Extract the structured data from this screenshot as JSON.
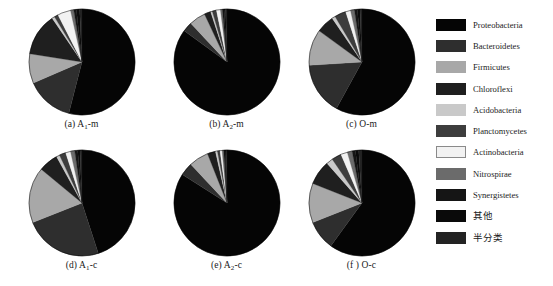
{
  "figure": {
    "background": "#ffffff"
  },
  "legend": {
    "position": "right",
    "items": [
      {
        "label": "Proteobacteria",
        "color": "#050505",
        "script": "latin"
      },
      {
        "label": "Bacteroidetes",
        "color": "#2e2e2e",
        "script": "latin"
      },
      {
        "label": "Firmicutes",
        "color": "#a8a8a8",
        "script": "latin"
      },
      {
        "label": "Chloroflexi",
        "color": "#1f1f1f",
        "script": "latin"
      },
      {
        "label": "Acidobacteria",
        "color": "#c9c9c9",
        "script": "latin"
      },
      {
        "label": "Planctomycetes",
        "color": "#3d3d3d",
        "script": "latin"
      },
      {
        "label": "Actinobacteria",
        "color": "#f2f2f2",
        "script": "latin"
      },
      {
        "label": "Nitrospirae",
        "color": "#6b6b6b",
        "script": "latin"
      },
      {
        "label": "Synergistetes",
        "color": "#151515",
        "script": "latin"
      },
      {
        "label": "其他",
        "color": "#0a0a0a",
        "script": "cjk"
      },
      {
        "label": "半分类",
        "color": "#232323",
        "script": "cjk"
      }
    ]
  },
  "chart_data": [
    {
      "type": "pie",
      "id": "a",
      "caption_prefix": "(a)",
      "caption_base": "A",
      "caption_sub": "1",
      "caption_suffix": "-m",
      "caption_text": "(a) A1-m",
      "start_angle": 0,
      "direction": "clockwise",
      "categories": [
        "Proteobacteria",
        "Bacteroidetes",
        "Firmicutes",
        "Chloroflexi",
        "Acidobacteria",
        "Planctomycetes",
        "Actinobacteria",
        "Nitrospirae",
        "Synergistetes",
        "其他",
        "半分类"
      ],
      "values": [
        54.0,
        14.5,
        9.0,
        13.0,
        0.8,
        1.2,
        4.0,
        1.0,
        0.8,
        1.0,
        0.7
      ],
      "title": "(a) A1-m"
    },
    {
      "type": "pie",
      "id": "b",
      "caption_prefix": "(b)",
      "caption_base": "A",
      "caption_sub": "2",
      "caption_suffix": "-m",
      "caption_text": "(b) A2-m",
      "start_angle": 0,
      "direction": "clockwise",
      "categories": [
        "Proteobacteria",
        "Bacteroidetes",
        "Firmicutes",
        "Chloroflexi",
        "Acidobacteria",
        "Planctomycetes",
        "Actinobacteria",
        "Nitrospirae",
        "Synergistetes",
        "其他",
        "半分类"
      ],
      "values": [
        85.0,
        3.0,
        5.0,
        2.0,
        0.5,
        1.3,
        1.2,
        0.6,
        0.5,
        0.5,
        0.4
      ],
      "title": "(b) A2-m"
    },
    {
      "type": "pie",
      "id": "c",
      "caption_prefix": "(c)",
      "caption_base": "O",
      "caption_sub": "",
      "caption_suffix": "-m",
      "caption_text": "(c) O-m",
      "start_angle": 0,
      "direction": "clockwise",
      "categories": [
        "Proteobacteria",
        "Bacteroidetes",
        "Firmicutes",
        "Chloroflexi",
        "Acidobacteria",
        "Planctomycetes",
        "Actinobacteria",
        "Nitrospirae",
        "Synergistetes",
        "其他",
        "半分类"
      ],
      "values": [
        58.0,
        16.0,
        11.0,
        5.5,
        1.0,
        3.5,
        1.5,
        1.2,
        0.9,
        0.8,
        0.6
      ],
      "title": "(c) O-m"
    },
    {
      "type": "pie",
      "id": "d",
      "caption_prefix": "(d)",
      "caption_base": "A",
      "caption_sub": "1",
      "caption_suffix": "-c",
      "caption_text": "(d) A1-c",
      "start_angle": 0,
      "direction": "clockwise",
      "categories": [
        "Proteobacteria",
        "Bacteroidetes",
        "Firmicutes",
        "Chloroflexi",
        "Acidobacteria",
        "Planctomycetes",
        "Actinobacteria",
        "Nitrospirae",
        "Synergistetes",
        "其他",
        "半分类"
      ],
      "values": [
        45.0,
        24.0,
        17.0,
        6.0,
        1.0,
        2.0,
        1.5,
        1.3,
        0.9,
        0.7,
        0.6
      ],
      "title": "(d) A1-c"
    },
    {
      "type": "pie",
      "id": "e",
      "caption_prefix": "(e)",
      "caption_base": "A",
      "caption_sub": "2",
      "caption_suffix": "-c",
      "caption_text": "(e) A2-c",
      "start_angle": 0,
      "direction": "clockwise",
      "categories": [
        "Proteobacteria",
        "Bacteroidetes",
        "Firmicutes",
        "Chloroflexi",
        "Acidobacteria",
        "Planctomycetes",
        "Actinobacteria",
        "Nitrospirae",
        "Synergistetes",
        "其他",
        "半分类"
      ],
      "values": [
        84.0,
        4.0,
        6.0,
        2.5,
        0.6,
        0.8,
        0.6,
        0.5,
        0.4,
        0.3,
        0.3
      ],
      "title": "(e) A2-c"
    },
    {
      "type": "pie",
      "id": "f",
      "caption_prefix": "(f )",
      "caption_base": "O",
      "caption_sub": "",
      "caption_suffix": "-c",
      "caption_text": "(f ) O-c",
      "start_angle": 0,
      "direction": "clockwise",
      "categories": [
        "Proteobacteria",
        "Bacteroidetes",
        "Firmicutes",
        "Chloroflexi",
        "Acidobacteria",
        "Planctomycetes",
        "Actinobacteria",
        "Nitrospirae",
        "Synergistetes",
        "其他",
        "半分类"
      ],
      "values": [
        60.0,
        9.0,
        12.0,
        7.5,
        2.0,
        3.0,
        2.0,
        1.5,
        1.0,
        1.0,
        1.0
      ],
      "title": "(f ) O-c"
    }
  ]
}
